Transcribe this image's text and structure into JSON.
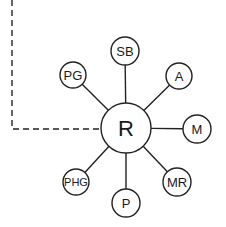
{
  "diagram": {
    "center": {
      "id": "R",
      "label": "R",
      "cx": 126,
      "cy": 128,
      "r": 25,
      "font_size": 22
    },
    "satellites": [
      {
        "id": "SB",
        "label": "SB",
        "cx": 125,
        "cy": 51,
        "r": 14,
        "font_size": 13
      },
      {
        "id": "A",
        "label": "A",
        "cx": 179,
        "cy": 76,
        "r": 13,
        "font_size": 13
      },
      {
        "id": "M",
        "label": "M",
        "cx": 197,
        "cy": 129,
        "r": 14,
        "font_size": 13
      },
      {
        "id": "MR",
        "label": "MR",
        "cx": 177,
        "cy": 182,
        "r": 14,
        "font_size": 13
      },
      {
        "id": "P",
        "label": "P",
        "cx": 126,
        "cy": 203,
        "r": 14,
        "font_size": 13
      },
      {
        "id": "PHG",
        "label": "PHG",
        "cx": 76,
        "cy": 182,
        "r": 13,
        "font_size": 11
      },
      {
        "id": "PG",
        "label": "PG",
        "cx": 73,
        "cy": 75,
        "r": 13,
        "font_size": 13
      }
    ],
    "dashed_connector": {
      "points": [
        [
          12,
          0
        ],
        [
          12,
          129
        ],
        [
          101,
          129
        ]
      ],
      "dash": "6 4"
    },
    "colors": {
      "stroke": "#222222",
      "background": "#ffffff"
    }
  }
}
